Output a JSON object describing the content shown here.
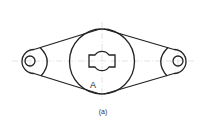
{
  "figure": {
    "part_label": "A",
    "caption": "(a)",
    "colors": {
      "outline": "#222222",
      "centerline": "#bbbbbb",
      "background": "#ffffff"
    }
  }
}
